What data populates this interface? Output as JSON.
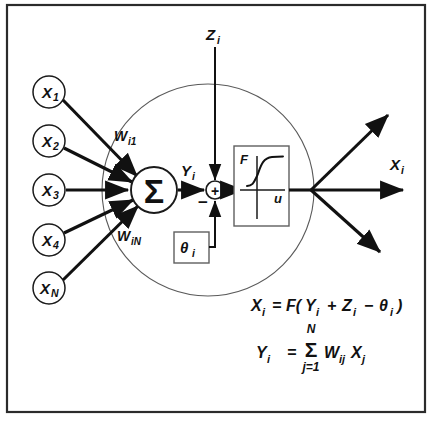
{
  "figure": {
    "colors": {
      "ink": "#111111",
      "frame": "#2b2b2b",
      "boundary": "#5a5a5a",
      "background": "#ffffff"
    }
  },
  "inputs": {
    "nodes": [
      {
        "base": "X",
        "sub": "1"
      },
      {
        "base": "X",
        "sub": "2"
      },
      {
        "base": "X",
        "sub": "3"
      },
      {
        "base": "X",
        "sub": "4"
      },
      {
        "base": "X",
        "sub": "N"
      }
    ]
  },
  "weights": [
    {
      "base": "W",
      "sub": "i1"
    },
    {
      "base": "W",
      "sub": "iN"
    }
  ],
  "neuron": {
    "summation_symbol": "Σ",
    "net_input": {
      "base": "Y",
      "sub": "i"
    },
    "external_input": {
      "base": "Z",
      "sub": "i"
    },
    "threshold": {
      "base": "θ",
      "sub": "i"
    },
    "junction_plus": "+",
    "junction_minus": "−"
  },
  "activation": {
    "vertical_axis": "F",
    "horizontal_axis": "u",
    "curve_type": "sigmoid"
  },
  "output": {
    "label": {
      "base": "X",
      "sub": "i"
    },
    "branch_count": 3
  },
  "equations": {
    "first": {
      "lhs_base": "X",
      "lhs_sub": "i",
      "eq": "=",
      "fn": "F(",
      "t1_base": "Y",
      "t1_sub": "i",
      "op1": "+",
      "t2_base": "Z",
      "t2_sub": "i",
      "op2": "−",
      "t3_base": "θ",
      "t3_sub": "i",
      "close": ")"
    },
    "second": {
      "lhs_base": "Y",
      "lhs_sub": "i",
      "eq": "=",
      "sigma": "Σ",
      "upper": "N",
      "lower": "j=1",
      "term1_base": "W",
      "term1_sub": "ij",
      "term2_base": "X",
      "term2_sub": "j"
    }
  }
}
